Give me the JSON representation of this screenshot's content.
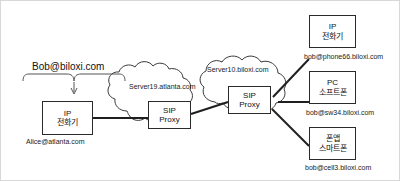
{
  "diagram": {
    "colors": {
      "stroke": "#2a2a2a",
      "cloud_stroke": "#3a3a3a",
      "text": "#111111",
      "frame": "#d8d8d8",
      "background": "#ffffff"
    },
    "brace": {
      "label": "Bob@biloxi.com",
      "name": "bob-identity-brace"
    },
    "nodes": [
      {
        "id": "alice-ip-phone",
        "line1": "IP",
        "line2": "전화기",
        "caption": "Alice@atlanta.com",
        "icon": "ip-phone-icon"
      },
      {
        "id": "bob-ip-phone",
        "line1": "IP",
        "line2": "전화기",
        "caption": "bob@phone66.biloxi.com",
        "icon": "ip-phone-icon"
      },
      {
        "id": "bob-pc-softphone",
        "line1": "PC",
        "line2": "소프트폰",
        "caption": "bob@sw34.biloxi.com",
        "icon": "pc-softphone-icon"
      },
      {
        "id": "bob-smartphone",
        "line1": "폰앱",
        "line2": "스마트폰",
        "caption": "bob@cell3.biloxi.com",
        "icon": "smartphone-icon"
      }
    ],
    "clouds": [
      {
        "id": "atlanta-cloud",
        "label": "Server19.atlanta.com",
        "proxy_line1": "SIP",
        "proxy_line2": "Proxy"
      },
      {
        "id": "biloxi-cloud",
        "label": "Server10.biloxi.com",
        "proxy_line1": "SIP",
        "proxy_line2": "Proxy"
      }
    ]
  }
}
